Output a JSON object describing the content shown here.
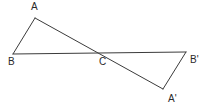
{
  "figure": {
    "background_color": "#ffffff",
    "stroke_color": "#3b3b3b",
    "label_color": "#2a2a2a",
    "vertices": [
      {
        "id": "A",
        "label": "A",
        "x": 35,
        "y": 18,
        "label_x": 31,
        "label_y": 2
      },
      {
        "id": "B",
        "label": "B",
        "x": 13,
        "y": 54,
        "label_x": 8,
        "label_y": 57
      },
      {
        "id": "C",
        "label": "C",
        "x": 103,
        "y": 53,
        "label_x": 99,
        "label_y": 57
      },
      {
        "id": "Bp",
        "label": "B'",
        "x": 186,
        "y": 52,
        "label_x": 190,
        "label_y": 55
      },
      {
        "id": "Ap",
        "label": "A'",
        "x": 163,
        "y": 89,
        "label_x": 168,
        "label_y": 94
      }
    ],
    "segments": [
      {
        "id": "A-B",
        "from": "A",
        "to": "B"
      },
      {
        "id": "B-Bp",
        "from": "B",
        "to": "Bp"
      },
      {
        "id": "A-Ap",
        "from": "A",
        "to": "Ap"
      },
      {
        "id": "Ap-Bp",
        "from": "Ap",
        "to": "Bp"
      }
    ]
  },
  "chart_data": {
    "type": "scatter",
    "xlabel": "",
    "ylabel": "",
    "xlim": [
      0,
      208
    ],
    "ylim": [
      0,
      110
    ],
    "grid": false,
    "legend": "none",
    "points": [
      {
        "name": "A",
        "x": 35,
        "y": 18
      },
      {
        "name": "B",
        "x": 13,
        "y": 54
      },
      {
        "name": "C",
        "x": 103,
        "y": 53
      },
      {
        "name": "B'",
        "x": 186,
        "y": 52
      },
      {
        "name": "A'",
        "x": 163,
        "y": 89
      }
    ],
    "annotations": [
      "A",
      "B",
      "C",
      "B'",
      "A'"
    ]
  }
}
